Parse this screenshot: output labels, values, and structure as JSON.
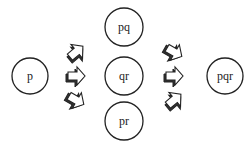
{
  "diagram": {
    "nodes": [
      {
        "id": "p",
        "label": "p",
        "cx": 30,
        "cy": 76,
        "r": 18
      },
      {
        "id": "pq",
        "label": "pq",
        "cx": 124,
        "cy": 27,
        "r": 19
      },
      {
        "id": "qr",
        "label": "qr",
        "cx": 124,
        "cy": 76,
        "r": 19
      },
      {
        "id": "pr",
        "label": "pr",
        "cx": 124,
        "cy": 121,
        "r": 19
      },
      {
        "id": "pqr",
        "label": "pqr",
        "cx": 225,
        "cy": 76,
        "r": 18
      }
    ],
    "arrow_groups": [
      {
        "name": "left-arrows",
        "from": "p",
        "to": [
          "pq",
          "qr",
          "pr"
        ]
      },
      {
        "name": "right-arrows",
        "from": [
          "pq",
          "qr",
          "pr"
        ],
        "to": "pqr"
      }
    ],
    "colors": {
      "stroke": "#222222",
      "fill": "#ffffff",
      "shadow": "#333333"
    }
  }
}
